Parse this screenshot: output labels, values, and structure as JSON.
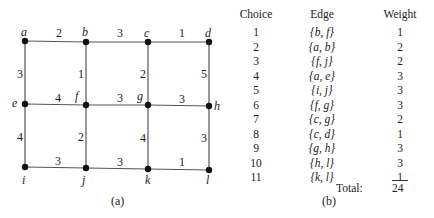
{
  "graph": {
    "vertices": [
      {
        "id": "a",
        "x": 25,
        "y": 41,
        "lx": 21,
        "ly": 36
      },
      {
        "id": "b",
        "x": 86,
        "y": 42,
        "lx": 82,
        "ly": 36
      },
      {
        "id": "c",
        "x": 148,
        "y": 42,
        "lx": 144,
        "ly": 37
      },
      {
        "id": "d",
        "x": 209,
        "y": 42,
        "lx": 205,
        "ly": 37
      },
      {
        "id": "e",
        "x": 25,
        "y": 104,
        "lx": 12,
        "ly": 107
      },
      {
        "id": "f",
        "x": 86,
        "y": 105,
        "lx": 75,
        "ly": 100
      },
      {
        "id": "g",
        "x": 148,
        "y": 105,
        "lx": 137,
        "ly": 100
      },
      {
        "id": "h",
        "x": 209,
        "y": 106,
        "lx": 214,
        "ly": 110
      },
      {
        "id": "i",
        "x": 25,
        "y": 167,
        "lx": 22,
        "ly": 184
      },
      {
        "id": "j",
        "x": 86,
        "y": 168,
        "lx": 82,
        "ly": 184
      },
      {
        "id": "k",
        "x": 148,
        "y": 169,
        "lx": 145,
        "ly": 184
      },
      {
        "id": "l",
        "x": 209,
        "y": 170,
        "lx": 206,
        "ly": 184
      }
    ],
    "edges": [
      {
        "from": "a",
        "to": "b",
        "w": "2",
        "lx": 56,
        "ly": 37
      },
      {
        "from": "b",
        "to": "c",
        "w": "3",
        "lx": 117,
        "ly": 37
      },
      {
        "from": "c",
        "to": "d",
        "w": "1",
        "lx": 179,
        "ly": 37
      },
      {
        "from": "a",
        "to": "e",
        "w": "3",
        "lx": 17,
        "ly": 78
      },
      {
        "from": "b",
        "to": "f",
        "w": "1",
        "lx": 78,
        "ly": 78
      },
      {
        "from": "c",
        "to": "g",
        "w": "2",
        "lx": 140,
        "ly": 78
      },
      {
        "from": "d",
        "to": "h",
        "w": "5",
        "lx": 201,
        "ly": 78
      },
      {
        "from": "e",
        "to": "f",
        "w": "4",
        "lx": 55,
        "ly": 102
      },
      {
        "from": "f",
        "to": "g",
        "w": "3",
        "lx": 117,
        "ly": 102
      },
      {
        "from": "g",
        "to": "h",
        "w": "3",
        "lx": 179,
        "ly": 103
      },
      {
        "from": "e",
        "to": "i",
        "w": "4",
        "lx": 17,
        "ly": 141
      },
      {
        "from": "f",
        "to": "j",
        "w": "2",
        "lx": 78,
        "ly": 141
      },
      {
        "from": "g",
        "to": "k",
        "w": "4",
        "lx": 140,
        "ly": 142
      },
      {
        "from": "h",
        "to": "l",
        "w": "3",
        "lx": 201,
        "ly": 142
      },
      {
        "from": "i",
        "to": "j",
        "w": "3",
        "lx": 55,
        "ly": 165
      },
      {
        "from": "j",
        "to": "k",
        "w": "3",
        "lx": 117,
        "ly": 166
      },
      {
        "from": "k",
        "to": "l",
        "w": "1",
        "lx": 179,
        "ly": 166
      }
    ],
    "caption": "(a)"
  },
  "table": {
    "headers": {
      "choice": "Choice",
      "edge": "Edge",
      "weight": "Weight"
    },
    "rows": [
      {
        "choice": "1",
        "edge": "{b, f}",
        "weight": "1"
      },
      {
        "choice": "2",
        "edge": "{a, b}",
        "weight": "2"
      },
      {
        "choice": "3",
        "edge": "{f, j}",
        "weight": "2"
      },
      {
        "choice": "4",
        "edge": "{a, e}",
        "weight": "3"
      },
      {
        "choice": "5",
        "edge": "{i, j}",
        "weight": "3"
      },
      {
        "choice": "6",
        "edge": "{f, g}",
        "weight": "3"
      },
      {
        "choice": "7",
        "edge": "{c, g}",
        "weight": "2"
      },
      {
        "choice": "8",
        "edge": "{c, d}",
        "weight": "1"
      },
      {
        "choice": "9",
        "edge": "{g, h}",
        "weight": "3"
      },
      {
        "choice": "10",
        "edge": "{h, l}",
        "weight": "3"
      },
      {
        "choice": "11",
        "edge": "{k, l}",
        "weight": "1"
      }
    ],
    "total_label": "Total:",
    "total_value": "24",
    "caption": "(b)"
  }
}
